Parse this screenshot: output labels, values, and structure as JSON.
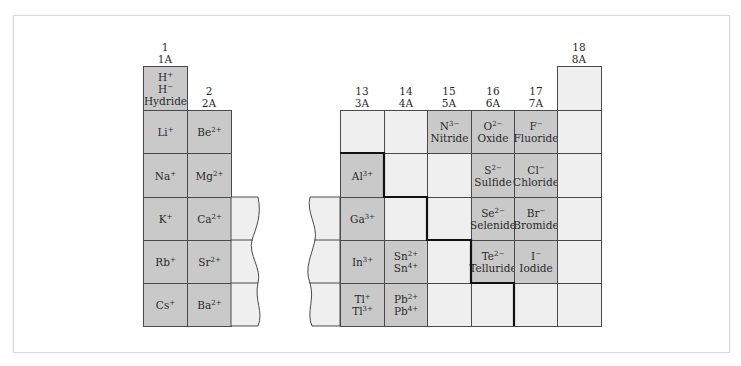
{
  "headers": {
    "g1": {
      "num": "1",
      "old": "1A"
    },
    "g2": {
      "num": "2",
      "old": "2A"
    },
    "g13": {
      "num": "13",
      "old": "3A"
    },
    "g14": {
      "num": "14",
      "old": "4A"
    },
    "g15": {
      "num": "15",
      "old": "5A"
    },
    "g16": {
      "num": "16",
      "old": "6A"
    },
    "g17": {
      "num": "17",
      "old": "7A"
    },
    "g18": {
      "num": "18",
      "old": "8A"
    }
  },
  "cells": {
    "h": {
      "l1": "H",
      "l1sup": "+",
      "l2": "H",
      "l2sup": "−",
      "name": "Hydride"
    },
    "li": {
      "sym": "Li",
      "sup": "+"
    },
    "be": {
      "sym": "Be",
      "sup": "2+"
    },
    "na": {
      "sym": "Na",
      "sup": "+"
    },
    "mg": {
      "sym": "Mg",
      "sup": "2+"
    },
    "k": {
      "sym": "K",
      "sup": "+"
    },
    "ca": {
      "sym": "Ca",
      "sup": "2+"
    },
    "rb": {
      "sym": "Rb",
      "sup": "+"
    },
    "sr": {
      "sym": "Sr",
      "sup": "2+"
    },
    "cs": {
      "sym": "Cs",
      "sup": "+"
    },
    "ba": {
      "sym": "Ba",
      "sup": "2+"
    },
    "al": {
      "sym": "Al",
      "sup": "3+"
    },
    "ga": {
      "sym": "Ga",
      "sup": "3+"
    },
    "in": {
      "sym": "In",
      "sup": "3+"
    },
    "sn": {
      "l1": "Sn",
      "l1sup": "2+",
      "l2": "Sn",
      "l2sup": "4+"
    },
    "tl": {
      "l1": "Tl",
      "l1sup": "+",
      "l2": "Tl",
      "l2sup": "3+"
    },
    "pb": {
      "l1": "Pb",
      "l1sup": "2+",
      "l2": "Pb",
      "l2sup": "4+"
    },
    "n": {
      "sym": "N",
      "sup": "3−",
      "name": "Nitride"
    },
    "o": {
      "sym": "O",
      "sup": "2−",
      "name": "Oxide"
    },
    "f": {
      "sym": "F",
      "sup": "−",
      "name": "Fluoride"
    },
    "s": {
      "sym": "S",
      "sup": "2−",
      "name": "Sulfide"
    },
    "cl": {
      "sym": "Cl",
      "sup": "−",
      "name": "Chloride"
    },
    "se": {
      "sym": "Se",
      "sup": "2−",
      "name": "Selenide"
    },
    "br": {
      "sym": "Br",
      "sup": "−",
      "name": "Bromide"
    },
    "te": {
      "sym": "Te",
      "sup": "2−",
      "name": "Telluride"
    },
    "i": {
      "sym": "I",
      "sup": "−",
      "name": "Iodide"
    }
  },
  "colors": {
    "shaded": "#c9c9c9",
    "empty": "#efefef",
    "line": "#4a4a4a",
    "boundary": "#111111"
  }
}
